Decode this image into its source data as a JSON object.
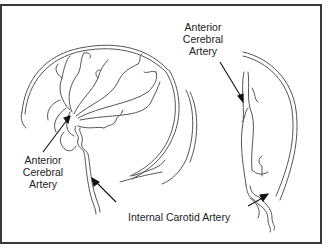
{
  "diagram": {
    "type": "anatomical illustration",
    "labels": {
      "left_view": [
        "Anterior",
        "Cerebral",
        "Artery"
      ],
      "right_view": [
        "Anterior",
        "Cerebral",
        "Artery"
      ],
      "bottom": "Internal Carotid Artery"
    },
    "colors": {
      "line": "#555555",
      "border": "#3a3a3a",
      "background": "#ffffff"
    }
  }
}
